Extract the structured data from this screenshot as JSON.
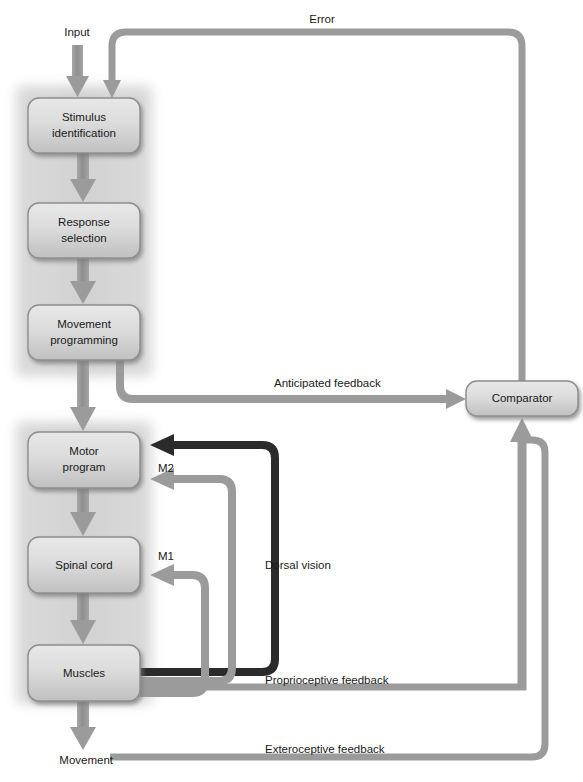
{
  "diagram": {
    "colors": {
      "panel_fill": "#d2d2d2",
      "box_fill_top": "#e2e2e2",
      "box_fill_bottom": "#c4c4c4",
      "box_stroke": "#8a8a8a",
      "arrow_gray": "#9a9a9a",
      "arrow_gray_dark": "#8e8e8e",
      "arrow_black": "#2b2b2b",
      "text": "#1a1a1a",
      "background": "#ffffff"
    },
    "panels": [
      {
        "name": "cognitive-stage-panel",
        "boxes": [
          "stimulus-identification",
          "response-selection",
          "movement-programming"
        ]
      },
      {
        "name": "execution-stage-panel",
        "boxes": [
          "motor-program",
          "spinal-cord",
          "muscles"
        ]
      }
    ],
    "boxes": [
      {
        "id": "stimulus-identification",
        "label": "Stimulus\nidentification",
        "line1": "Stimulus",
        "line2": "identification"
      },
      {
        "id": "response-selection",
        "label": "Response\nselection",
        "line1": "Response",
        "line2": "selection"
      },
      {
        "id": "movement-programming",
        "label": "Movement\nprogramming",
        "line1": "Movement",
        "line2": "programming"
      },
      {
        "id": "motor-program",
        "label": "Motor\nprogram",
        "line1": "Motor",
        "line2": "program"
      },
      {
        "id": "spinal-cord",
        "label": "Spinal cord",
        "line1": "Spinal cord",
        "line2": ""
      },
      {
        "id": "muscles",
        "label": "Muscles",
        "line1": "Muscles",
        "line2": ""
      },
      {
        "id": "comparator",
        "label": "Comparator",
        "line1": "Comparator",
        "line2": ""
      }
    ],
    "edge_labels": {
      "input": "Input",
      "error": "Error",
      "anticipated_feedback": "Anticipated feedback",
      "m2": "M2",
      "m1": "M1",
      "dorsal_vision": "Dorsal vision",
      "proprioceptive_feedback": "Proprioceptive feedback",
      "exteroceptive_feedback": "Exteroceptive feedback",
      "movement": "Movement"
    }
  }
}
